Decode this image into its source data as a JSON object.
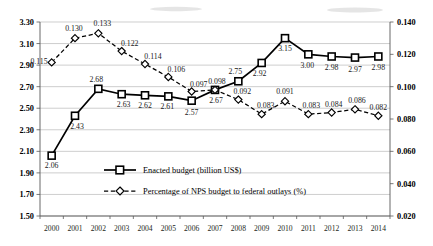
{
  "chart_data": {
    "type": "line",
    "title": "",
    "xlabel": "",
    "ylabel": "",
    "grid": true,
    "legend_position": "inside-bottom-left",
    "categories": [
      "2000",
      "2001",
      "2002",
      "2003",
      "2004",
      "2005",
      "2006",
      "2007",
      "2008",
      "2009",
      "2010",
      "2011",
      "2012",
      "2013",
      "2014"
    ],
    "axes": {
      "left": {
        "ylim": [
          1.5,
          3.3
        ],
        "step": 0.2,
        "ticks": [
          "1.50",
          "1.70",
          "1.90",
          "2.10",
          "2.30",
          "2.50",
          "2.70",
          "2.90",
          "3.10",
          "3.30"
        ]
      },
      "right": {
        "ylim": [
          0.02,
          0.14
        ],
        "step": 0.02,
        "ticks": [
          "0.020",
          "0.040",
          "0.060",
          "0.080",
          "0.100",
          "0.120",
          "0.140"
        ]
      }
    },
    "series": [
      {
        "name": "Enacted budget (billion US$)",
        "axis": "left",
        "marker": "square",
        "line": "solid",
        "values": [
          2.06,
          2.43,
          2.68,
          2.63,
          2.62,
          2.61,
          2.57,
          2.67,
          2.75,
          2.92,
          3.15,
          3.0,
          2.98,
          2.97,
          2.98
        ],
        "labels": [
          "2.06",
          "2.43",
          "2.68",
          "2.63",
          "2.62",
          "2.61",
          "2.57",
          "2.67",
          "2.75",
          "2.92",
          "3.15",
          "3.00",
          "2.98",
          "2.97",
          "2.98"
        ]
      },
      {
        "name": "Percentage of NPS budget to federal outlays (%)",
        "axis": "right",
        "marker": "diamond",
        "line": "dashed",
        "values": [
          0.115,
          0.13,
          0.133,
          0.122,
          0.114,
          0.106,
          0.097,
          0.098,
          0.092,
          0.083,
          0.091,
          0.083,
          0.084,
          0.086,
          0.082
        ],
        "labels": [
          "0.115",
          "0.130",
          "0.133",
          "0.122",
          "0.114",
          "0.106",
          "0.097",
          "0.098",
          "0.092",
          "0.083",
          "0.091",
          "0.083",
          "0.084",
          "0.086",
          "0.082"
        ]
      }
    ]
  },
  "legend": {
    "items": [
      {
        "label": "Enacted budget (billion US$)"
      },
      {
        "label": "Percentage of NPS budget to federal outlays (%)"
      }
    ]
  }
}
